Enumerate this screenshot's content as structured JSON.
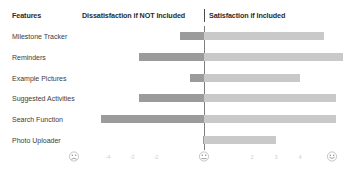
{
  "header": {
    "features_label": "Features",
    "dissatisfaction_label": "Dissatisfaction if NOT Included",
    "satisfaction_label": "Satisfaction if  Included"
  },
  "axis": {
    "ticks": [
      "-5",
      "-4",
      "-3",
      "-2",
      "-1",
      "0",
      "1",
      "2",
      "3",
      "4",
      "5"
    ],
    "visible_tick_labels": [
      "-4",
      "-3",
      "-2",
      "2",
      "3",
      "4"
    ],
    "left_face": "frowning-face-icon",
    "center_face": "neutral-face-icon",
    "right_face": "smiling-face-icon"
  },
  "colors": {
    "negative_bar": "#9b9b9b",
    "positive_bar": "#c9c9c9",
    "axis": "#7d7d7d",
    "text": "#3c3c3c",
    "background": "#ffffff"
  },
  "chart_data": {
    "type": "bar",
    "title": "",
    "subtitle": "",
    "xlabel": "",
    "ylabel": "Features",
    "xlim": [
      -5,
      5
    ],
    "grid": false,
    "legend_position": "top",
    "orientation": "horizontal",
    "diverging": true,
    "categories": [
      "Milestone Tracker",
      "Reminders",
      "Example Pictures",
      "Suggested Activities",
      "Search Function",
      "Photo Uploader"
    ],
    "series": [
      {
        "name": "Dissatisfaction if NOT Included",
        "color": "#9b9b9b",
        "values": [
          -1.0,
          -2.7,
          -0.6,
          -2.7,
          -4.3,
          -0.05
        ]
      },
      {
        "name": "Satisfaction if  Included",
        "color": "#c9c9c9",
        "values": [
          5.0,
          5.8,
          4.0,
          5.5,
          5.5,
          3.0
        ]
      }
    ]
  }
}
